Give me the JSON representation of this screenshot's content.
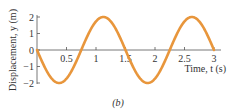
{
  "chart_data": {
    "type": "line",
    "title": "",
    "caption": "(b)",
    "xlabel": "Time, t (s)",
    "ylabel": "Displacement, y (m)",
    "xlim": [
      0,
      3.1
    ],
    "ylim": [
      -2,
      2
    ],
    "x_ticks": [
      0.5,
      1,
      1.5,
      2,
      2.5,
      3
    ],
    "x_tick_labels": [
      "0.5",
      "1",
      "1.5",
      "2",
      "2.5",
      "3"
    ],
    "y_ticks": [
      2,
      1,
      0,
      -1,
      -2
    ],
    "y_tick_labels": [
      "2",
      "1",
      "0",
      "−1",
      "−2"
    ],
    "grid": false,
    "legend": null,
    "series": [
      {
        "name": "displacement",
        "color": "#E8963C",
        "function": "y = -2 sin(2π t / 1.5)",
        "amplitude": 2,
        "period": 1.5,
        "x": [
          0,
          0.375,
          0.75,
          1.125,
          1.5,
          1.875,
          2.25,
          2.625,
          3
        ],
        "values": [
          0,
          -2,
          0,
          2,
          0,
          -2,
          0,
          2,
          0
        ]
      }
    ]
  },
  "colors": {
    "curve": "#E8963C",
    "axis": "#555555",
    "text": "#333333"
  }
}
